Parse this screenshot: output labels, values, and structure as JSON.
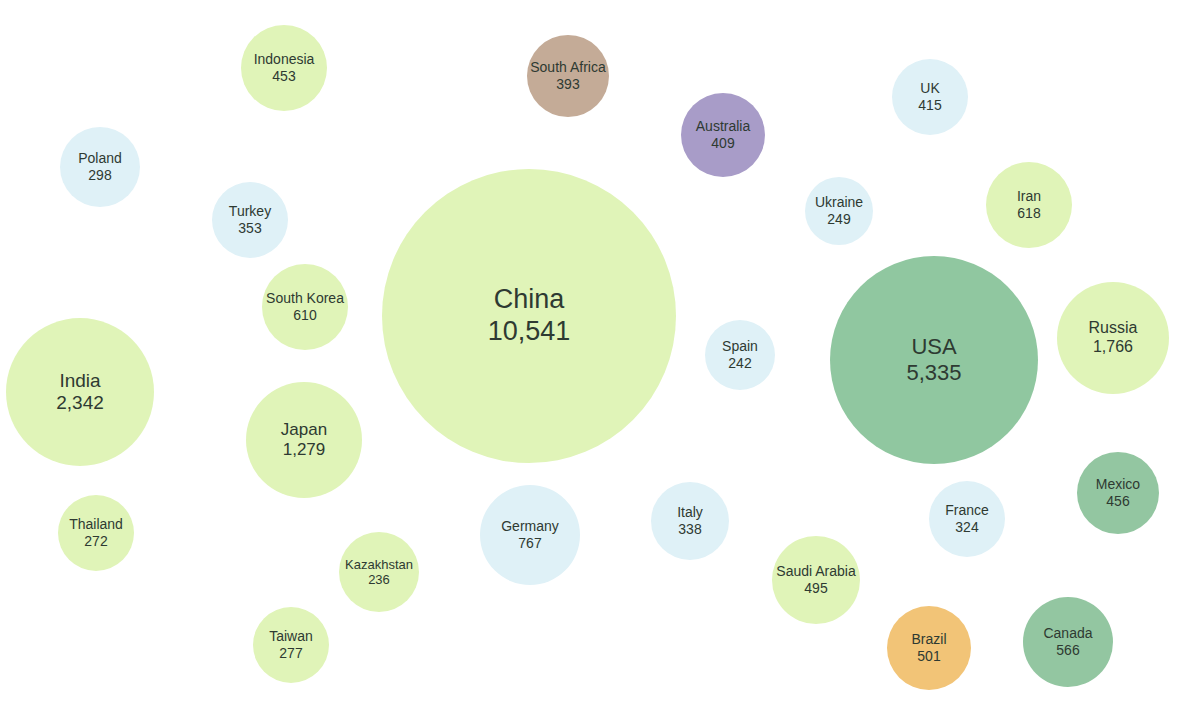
{
  "chart_data": {
    "type": "bubble",
    "title": "",
    "subtitle": "",
    "xlabel": "",
    "ylabel": "",
    "legend": [],
    "grid": false,
    "value_unit": "",
    "categories": [
      "China",
      "USA",
      "India",
      "Russia",
      "Japan",
      "Germany",
      "Iran",
      "South Korea",
      "Canada",
      "Brazil",
      "Saudi Arabia",
      "Mexico",
      "Indonesia",
      "UK",
      "Australia",
      "South Africa",
      "Turkey",
      "Italy",
      "France",
      "Poland",
      "Taiwan",
      "Thailand",
      "Ukraine",
      "Spain",
      "Kazakhstan"
    ],
    "values": [
      10541,
      5335,
      2342,
      1766,
      1279,
      767,
      618,
      610,
      566,
      501,
      495,
      456,
      453,
      415,
      409,
      393,
      353,
      338,
      324,
      298,
      277,
      272,
      249,
      242,
      236
    ],
    "color_groups": {
      "light-green": "#e0f4b8",
      "light-blue": "#dff1f7",
      "medium-green": "#93c6a1",
      "purple": "#a89cc8",
      "tan-brown": "#c4ab97",
      "orange": "#f2c477"
    },
    "bubbles": [
      {
        "name": "China",
        "value": 10541,
        "label": "10,541",
        "cx": 529,
        "cy": 316,
        "r": 147,
        "color": "#e0f4b8",
        "font": 27
      },
      {
        "name": "USA",
        "value": 5335,
        "label": "5,335",
        "cx": 934,
        "cy": 360,
        "r": 104,
        "color": "#90c7a0",
        "font": 22
      },
      {
        "name": "India",
        "value": 2342,
        "label": "2,342",
        "cx": 80,
        "cy": 392,
        "r": 74,
        "color": "#e0f4b8",
        "font": 19
      },
      {
        "name": "Russia",
        "value": 1766,
        "label": "1,766",
        "cx": 1113,
        "cy": 338,
        "r": 56,
        "color": "#e0f4b8",
        "font": 16
      },
      {
        "name": "Japan",
        "value": 1279,
        "label": "1,279",
        "cx": 304,
        "cy": 440,
        "r": 58,
        "color": "#e0f4b8",
        "font": 17
      },
      {
        "name": "Germany",
        "value": 767,
        "label": "767",
        "cx": 530,
        "cy": 535,
        "r": 50,
        "color": "#dff1f7",
        "font": 14
      },
      {
        "name": "Iran",
        "value": 618,
        "label": "618",
        "cx": 1029,
        "cy": 205,
        "r": 43,
        "color": "#e0f4b8",
        "font": 14
      },
      {
        "name": "South Korea",
        "value": 610,
        "label": "610",
        "cx": 305,
        "cy": 307,
        "r": 43,
        "color": "#e0f4b8",
        "font": 14
      },
      {
        "name": "Canada",
        "value": 566,
        "label": "566",
        "cx": 1068,
        "cy": 642,
        "r": 45,
        "color": "#93c6a1",
        "font": 14
      },
      {
        "name": "Brazil",
        "value": 501,
        "label": "501",
        "cx": 929,
        "cy": 648,
        "r": 42,
        "color": "#f2c477",
        "font": 14
      },
      {
        "name": "Saudi Arabia",
        "value": 495,
        "label": "495",
        "cx": 816,
        "cy": 580,
        "r": 44,
        "color": "#e0f4b8",
        "font": 14
      },
      {
        "name": "Mexico",
        "value": 456,
        "label": "456",
        "cx": 1118,
        "cy": 493,
        "r": 41,
        "color": "#93c6a1",
        "font": 14
      },
      {
        "name": "Indonesia",
        "value": 453,
        "label": "453",
        "cx": 284,
        "cy": 68,
        "r": 43,
        "color": "#e0f4b8",
        "font": 14
      },
      {
        "name": "UK",
        "value": 415,
        "label": "415",
        "cx": 930,
        "cy": 97,
        "r": 38,
        "color": "#dff1f7",
        "font": 14
      },
      {
        "name": "Australia",
        "value": 409,
        "label": "409",
        "cx": 723,
        "cy": 135,
        "r": 42,
        "color": "#a89cc8",
        "font": 14
      },
      {
        "name": "South Africa",
        "value": 393,
        "label": "393",
        "cx": 568,
        "cy": 76,
        "r": 41,
        "color": "#c4ab97",
        "font": 14
      },
      {
        "name": "Turkey",
        "value": 353,
        "label": "353",
        "cx": 250,
        "cy": 220,
        "r": 38,
        "color": "#dff1f7",
        "font": 14
      },
      {
        "name": "Italy",
        "value": 338,
        "label": "338",
        "cx": 690,
        "cy": 521,
        "r": 39,
        "color": "#dff1f7",
        "font": 14
      },
      {
        "name": "France",
        "value": 324,
        "label": "324",
        "cx": 967,
        "cy": 519,
        "r": 38,
        "color": "#dff1f7",
        "font": 14
      },
      {
        "name": "Poland",
        "value": 298,
        "label": "298",
        "cx": 100,
        "cy": 167,
        "r": 40,
        "color": "#dff1f7",
        "font": 14
      },
      {
        "name": "Taiwan",
        "value": 277,
        "label": "277",
        "cx": 291,
        "cy": 645,
        "r": 38,
        "color": "#e0f4b8",
        "font": 14
      },
      {
        "name": "Thailand",
        "value": 272,
        "label": "272",
        "cx": 96,
        "cy": 533,
        "r": 38,
        "color": "#e0f4b8",
        "font": 14
      },
      {
        "name": "Ukraine",
        "value": 249,
        "label": "249",
        "cx": 839,
        "cy": 211,
        "r": 34,
        "color": "#dff1f7",
        "font": 14
      },
      {
        "name": "Spain",
        "value": 242,
        "label": "242",
        "cx": 740,
        "cy": 355,
        "r": 35,
        "color": "#dff1f7",
        "font": 14
      },
      {
        "name": "Kazakhstan",
        "value": 236,
        "label": "236",
        "cx": 379,
        "cy": 572,
        "r": 40,
        "color": "#e0f4b8",
        "font": 13
      }
    ]
  }
}
